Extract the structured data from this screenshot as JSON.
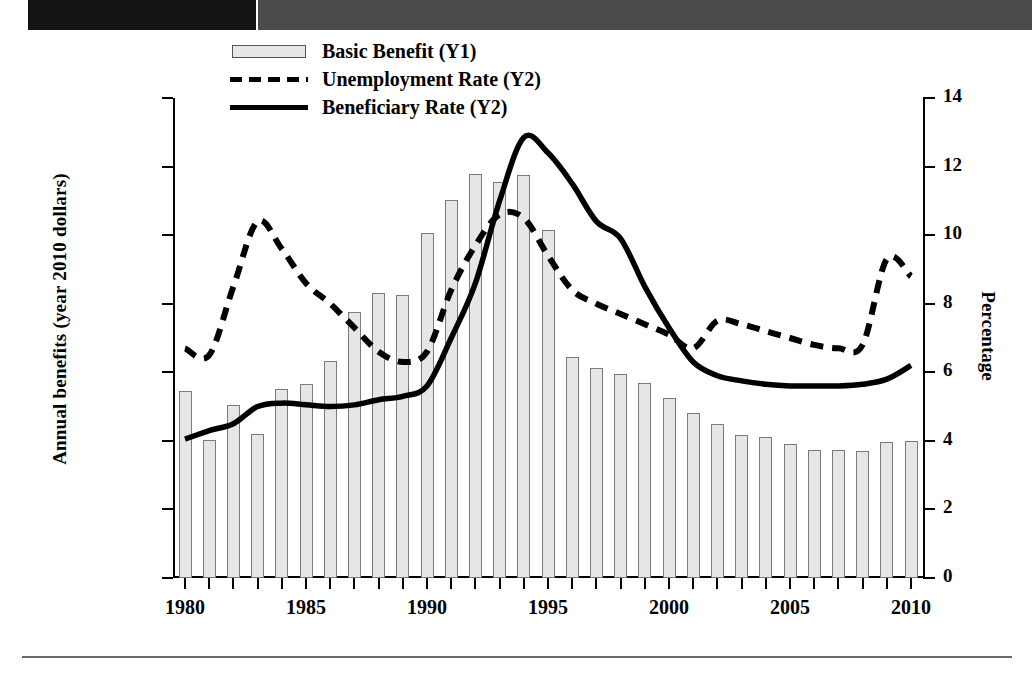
{
  "page": {
    "top_bar": {
      "dark_color": "#141414",
      "gray_color": "#4a4a4a"
    },
    "rule_color": "#6a6a6a"
  },
  "legend": {
    "items": [
      {
        "label": "Basic Benefit (Y1)",
        "key": "bar-swatch"
      },
      {
        "label": "Unemployment Rate (Y2)",
        "key": "dashed-line-swatch"
      },
      {
        "label": "Beneficiary Rate (Y2)",
        "key": "solid-line-swatch"
      }
    ]
  },
  "chart_data": {
    "type": "bar",
    "title": "",
    "xlabel": "",
    "ylabel": "Annual benefits (year 2010 dollars)",
    "y2label": "Percentage",
    "grid": false,
    "legend_position": "top-center",
    "ylim": [
      5000,
      12000
    ],
    "y2lim": [
      0,
      14
    ],
    "xlim": [
      1980,
      2010
    ],
    "ytick_labels": [
      "$5,000",
      "$6,000",
      "$7,000",
      "$8,000",
      "$9,000",
      "$10,000",
      "$11,000",
      "$12,000"
    ],
    "ytick_values": [
      5000,
      6000,
      7000,
      8000,
      9000,
      10000,
      11000,
      12000
    ],
    "y2tick_labels": [
      "0",
      "2",
      "4",
      "6",
      "8",
      "10",
      "12",
      "14"
    ],
    "y2tick_values": [
      0,
      2,
      4,
      6,
      8,
      10,
      12,
      14
    ],
    "xtick_labels": [
      "1980",
      "1985",
      "1990",
      "1995",
      "2000",
      "2005",
      "2010"
    ],
    "xtick_values": [
      1980,
      1985,
      1990,
      1995,
      2000,
      2005,
      2010
    ],
    "x": [
      1980,
      1981,
      1982,
      1983,
      1984,
      1985,
      1986,
      1987,
      1988,
      1989,
      1990,
      1991,
      1992,
      1993,
      1994,
      1995,
      1996,
      1997,
      1998,
      1999,
      2000,
      2001,
      2002,
      2003,
      2004,
      2005,
      2006,
      2007,
      2008,
      2009,
      2010
    ],
    "series": [
      {
        "name": "Basic Benefit (Y1)",
        "axis": "y1",
        "type": "bar",
        "color": "#e6e6e6",
        "edge_color": "#7a7a7a",
        "values": [
          7720,
          7010,
          7530,
          7100,
          7760,
          7830,
          8170,
          8880,
          9160,
          9120,
          10030,
          10510,
          10890,
          10780,
          10880,
          10070,
          8230,
          8060,
          7980,
          7840,
          7620,
          7410,
          7240,
          7080,
          7060,
          6960,
          6870,
          6860,
          6850,
          6980,
          7000
        ]
      },
      {
        "name": "Unemployment Rate (Y2)",
        "axis": "y2",
        "type": "line",
        "style": "dashed",
        "color": "#000000",
        "values": [
          6.7,
          6.5,
          8.5,
          10.4,
          9.6,
          8.6,
          8.0,
          7.3,
          6.6,
          6.3,
          6.6,
          8.4,
          9.7,
          10.6,
          10.5,
          9.4,
          8.4,
          8.0,
          7.7,
          7.4,
          7.1,
          6.7,
          7.5,
          7.4,
          7.2,
          7.0,
          6.8,
          6.7,
          6.8,
          9.3,
          8.8
        ]
      },
      {
        "name": "Beneficiary Rate (Y2)",
        "axis": "y2",
        "type": "line",
        "style": "solid",
        "color": "#000000",
        "values": [
          4.05,
          4.3,
          4.5,
          5.0,
          5.1,
          5.05,
          5.0,
          5.05,
          5.2,
          5.3,
          5.6,
          7.0,
          8.6,
          11.0,
          12.85,
          12.4,
          11.5,
          10.4,
          9.9,
          8.5,
          7.3,
          6.3,
          5.9,
          5.75,
          5.65,
          5.6,
          5.6,
          5.6,
          5.65,
          5.8,
          6.2
        ]
      }
    ]
  }
}
